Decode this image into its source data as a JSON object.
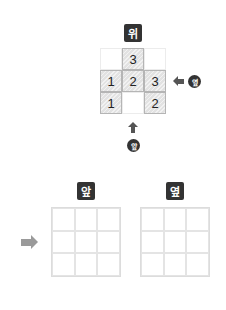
{
  "puzzle": {
    "top_label": "위",
    "side_label": "옆",
    "front_label": "앞",
    "grid": [
      [
        {
          "filled": false,
          "value": ""
        },
        {
          "filled": true,
          "value": "3"
        },
        {
          "filled": false,
          "value": ""
        }
      ],
      [
        {
          "filled": true,
          "value": "1"
        },
        {
          "filled": true,
          "value": "2"
        },
        {
          "filled": true,
          "value": "3"
        }
      ],
      [
        {
          "filled": true,
          "value": "1"
        },
        {
          "filled": false,
          "value": ""
        },
        {
          "filled": true,
          "value": "2"
        }
      ]
    ],
    "side_arrow_icon": "arrow-left-icon",
    "front_arrow_icon": "arrow-up-icon"
  },
  "answer": {
    "arrow_icon": "arrow-right-icon",
    "front_view": {
      "label": "앞",
      "rows": 3,
      "cols": 3
    },
    "side_view": {
      "label": "옆",
      "rows": 3,
      "cols": 3
    }
  },
  "colors": {
    "label_bg": "#333333",
    "filled_cell": "#e2e2e2",
    "arrow_dark": "#555555",
    "arrow_light": "#9a9a9a"
  }
}
